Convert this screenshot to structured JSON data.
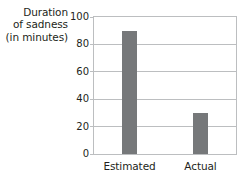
{
  "chart_data": {
    "type": "bar",
    "title": "",
    "xlabel": "",
    "ylabel": "Duration of sadness (in minutes)",
    "ylabel_lines": [
      "Duration",
      "of sadness",
      "(in minutes)"
    ],
    "categories": [
      "Estimated",
      "Actual"
    ],
    "values": [
      90,
      30
    ],
    "ylim": [
      0,
      100
    ],
    "yticks": [
      0,
      20,
      40,
      60,
      80,
      100
    ],
    "ytick_labels": [
      "0",
      "20",
      "40",
      "60",
      "80",
      "100"
    ],
    "grid": true,
    "legend": "none",
    "bar_color": "#76787a",
    "grid_color": "#bcbec0",
    "text_color": "#231f20",
    "background": "#ffffff"
  }
}
